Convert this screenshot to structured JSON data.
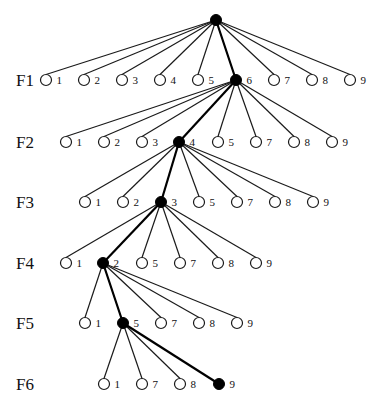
{
  "diagram": {
    "type": "search-tree",
    "colors": {
      "edge": "#1a1a1a",
      "path_edge": "#000000",
      "open_node_fill": "#ffffff",
      "selected_node_fill": "#000000"
    },
    "root": {
      "x": 216,
      "y": 20
    },
    "levels": [
      {
        "label": "F1",
        "label_x": 16,
        "y": 80,
        "parent": {
          "x": 216,
          "y": 20
        },
        "nodes": [
          {
            "label": "1",
            "x": 46,
            "selected": false
          },
          {
            "label": "2",
            "x": 84,
            "selected": false
          },
          {
            "label": "3",
            "x": 122,
            "selected": false
          },
          {
            "label": "4",
            "x": 160,
            "selected": false
          },
          {
            "label": "5",
            "x": 198,
            "selected": false
          },
          {
            "label": "6",
            "x": 236,
            "selected": true
          },
          {
            "label": "7",
            "x": 274,
            "selected": false
          },
          {
            "label": "8",
            "x": 312,
            "selected": false
          },
          {
            "label": "9",
            "x": 350,
            "selected": false
          }
        ]
      },
      {
        "label": "F2",
        "label_x": 16,
        "y": 142,
        "parent": {
          "x": 236,
          "y": 80
        },
        "nodes": [
          {
            "label": "1",
            "x": 66,
            "selected": false
          },
          {
            "label": "2",
            "x": 104,
            "selected": false
          },
          {
            "label": "3",
            "x": 142,
            "selected": false
          },
          {
            "label": "4",
            "x": 179,
            "selected": true
          },
          {
            "label": "5",
            "x": 218,
            "selected": false
          },
          {
            "label": "7",
            "x": 256,
            "selected": false
          },
          {
            "label": "8",
            "x": 294,
            "selected": false
          },
          {
            "label": "9",
            "x": 332,
            "selected": false
          }
        ]
      },
      {
        "label": "F3",
        "label_x": 16,
        "y": 202,
        "parent": {
          "x": 179,
          "y": 142
        },
        "nodes": [
          {
            "label": "1",
            "x": 85,
            "selected": false
          },
          {
            "label": "2",
            "x": 123,
            "selected": false
          },
          {
            "label": "3",
            "x": 161,
            "selected": true
          },
          {
            "label": "5",
            "x": 199,
            "selected": false
          },
          {
            "label": "7",
            "x": 237,
            "selected": false
          },
          {
            "label": "8",
            "x": 275,
            "selected": false
          },
          {
            "label": "9",
            "x": 313,
            "selected": false
          }
        ]
      },
      {
        "label": "F4",
        "label_x": 16,
        "y": 263,
        "parent": {
          "x": 161,
          "y": 202
        },
        "nodes": [
          {
            "label": "1",
            "x": 66,
            "selected": false
          },
          {
            "label": "2",
            "x": 103,
            "selected": true
          },
          {
            "label": "5",
            "x": 142,
            "selected": false
          },
          {
            "label": "7",
            "x": 180,
            "selected": false
          },
          {
            "label": "8",
            "x": 218,
            "selected": false
          },
          {
            "label": "9",
            "x": 256,
            "selected": false
          }
        ]
      },
      {
        "label": "F5",
        "label_x": 16,
        "y": 323,
        "parent": {
          "x": 103,
          "y": 263
        },
        "nodes": [
          {
            "label": "1",
            "x": 85,
            "selected": false
          },
          {
            "label": "5",
            "x": 123,
            "selected": true
          },
          {
            "label": "7",
            "x": 161,
            "selected": false
          },
          {
            "label": "8",
            "x": 199,
            "selected": false
          },
          {
            "label": "9",
            "x": 237,
            "selected": false
          }
        ]
      },
      {
        "label": "F6",
        "label_x": 16,
        "y": 384,
        "parent": {
          "x": 123,
          "y": 323
        },
        "nodes": [
          {
            "label": "1",
            "x": 104,
            "selected": false
          },
          {
            "label": "7",
            "x": 142,
            "selected": false
          },
          {
            "label": "8",
            "x": 180,
            "selected": false
          },
          {
            "label": "9",
            "x": 219,
            "selected": true
          }
        ]
      }
    ]
  }
}
